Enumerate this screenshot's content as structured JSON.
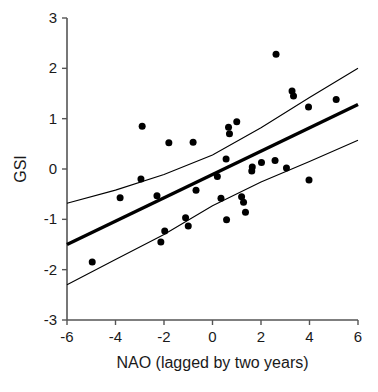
{
  "chart_data": {
    "type": "scatter",
    "title": "",
    "xlabel": "NAO (lagged by two years)",
    "ylabel": "GSI",
    "xlim": [
      -6,
      6
    ],
    "ylim": [
      -3,
      3
    ],
    "xticks": [
      -6,
      -4,
      -2,
      0,
      2,
      4,
      6
    ],
    "xtick_labels": [
      "-6",
      "-4",
      "-2",
      "0",
      "2",
      "4",
      "6"
    ],
    "yticks": [
      -3,
      -2,
      -1,
      0,
      1,
      2,
      3
    ],
    "ytick_labels": [
      "-3",
      "-2",
      "-1",
      "0",
      "1",
      "2",
      "3"
    ],
    "grid": false,
    "legend": null,
    "marker": {
      "shape": "circle",
      "color": "#000000",
      "size": 7
    },
    "points": [
      {
        "x": -4.96,
        "y": -1.85
      },
      {
        "x": -3.81,
        "y": -0.57
      },
      {
        "x": -2.95,
        "y": -0.2
      },
      {
        "x": -2.9,
        "y": 0.85
      },
      {
        "x": -2.29,
        "y": -0.53
      },
      {
        "x": -2.13,
        "y": -1.45
      },
      {
        "x": -1.97,
        "y": -1.23
      },
      {
        "x": -1.8,
        "y": 0.52
      },
      {
        "x": -1.11,
        "y": -0.97
      },
      {
        "x": -1.0,
        "y": -1.13
      },
      {
        "x": -0.8,
        "y": 0.53
      },
      {
        "x": -0.68,
        "y": -0.42
      },
      {
        "x": 0.2,
        "y": -0.15
      },
      {
        "x": 0.35,
        "y": -0.58
      },
      {
        "x": 0.56,
        "y": 0.2
      },
      {
        "x": 0.58,
        "y": -1.01
      },
      {
        "x": 0.66,
        "y": 0.83
      },
      {
        "x": 0.7,
        "y": 0.7
      },
      {
        "x": 1.0,
        "y": 0.94
      },
      {
        "x": 1.2,
        "y": -0.55
      },
      {
        "x": 1.28,
        "y": -0.66
      },
      {
        "x": 1.36,
        "y": -0.86
      },
      {
        "x": 1.62,
        "y": -0.04
      },
      {
        "x": 1.64,
        "y": 0.04
      },
      {
        "x": 2.02,
        "y": 0.13
      },
      {
        "x": 2.58,
        "y": 0.17
      },
      {
        "x": 2.62,
        "y": 2.28
      },
      {
        "x": 3.05,
        "y": 0.02
      },
      {
        "x": 3.28,
        "y": 1.55
      },
      {
        "x": 3.34,
        "y": 1.45
      },
      {
        "x": 3.96,
        "y": 1.23
      },
      {
        "x": 3.98,
        "y": -0.22
      },
      {
        "x": 5.1,
        "y": 1.38
      }
    ],
    "regression_line": {
      "name": "fitted regression",
      "style": "solid-thick",
      "color": "#000000",
      "x": [
        -6,
        6
      ],
      "y": [
        -1.5,
        1.28
      ]
    },
    "confidence_bands": [
      {
        "name": "upper confidence band",
        "style": "solid-thin",
        "color": "#000000",
        "x": [
          -6,
          -4,
          -2,
          0,
          2,
          4,
          6
        ],
        "y": [
          -0.68,
          -0.42,
          -0.11,
          0.28,
          0.82,
          1.42,
          2.0
        ]
      },
      {
        "name": "lower confidence band",
        "style": "solid-thin",
        "color": "#000000",
        "x": [
          -6,
          -4,
          -2,
          0,
          2,
          4,
          6
        ],
        "y": [
          -2.3,
          -1.8,
          -1.3,
          -0.73,
          -0.26,
          0.15,
          0.57
        ]
      }
    ]
  }
}
